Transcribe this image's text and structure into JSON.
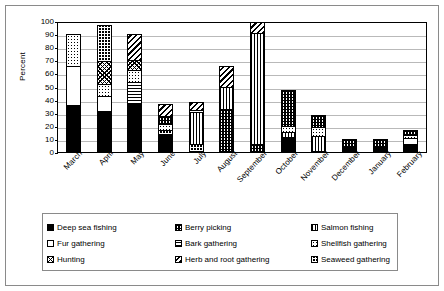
{
  "chart_data": {
    "type": "bar",
    "subtype": "stacked-bar",
    "title": "",
    "xlabel": "",
    "ylabel": "Percent",
    "ylim": [
      0,
      100
    ],
    "ytick_step": 10,
    "yticks": [
      100,
      90,
      80,
      70,
      60,
      50,
      40,
      30,
      20,
      10,
      0
    ],
    "grid": true,
    "grid_axis": "y",
    "legend_position": "bottom",
    "categories": [
      "March",
      "April",
      "May",
      "June",
      "July",
      "August",
      "September",
      "October",
      "November",
      "December",
      "January",
      "February"
    ],
    "series": [
      {
        "name": "Deep sea fishing",
        "pattern": "solid-black",
        "values": [
          35,
          30,
          36,
          13,
          0,
          0,
          0,
          10,
          0,
          3,
          3,
          5
        ]
      },
      {
        "name": "Fur gathering",
        "pattern": "solid-white",
        "values": [
          30,
          12,
          0,
          0,
          0,
          0,
          0,
          0,
          0,
          0,
          0,
          5
        ]
      },
      {
        "name": "Hunting",
        "pattern": "cross-hatch",
        "values": [
          0,
          18,
          8,
          0,
          0,
          0,
          0,
          0,
          0,
          0,
          0,
          0
        ]
      },
      {
        "name": "Berry picking",
        "pattern": "fine-checker",
        "values": [
          0,
          0,
          0,
          6,
          0,
          32,
          5,
          28,
          9,
          7,
          7,
          4
        ]
      },
      {
        "name": "Bark gathering",
        "pattern": "horizontal-lines",
        "values": [
          0,
          0,
          17,
          0,
          0,
          0,
          0,
          0,
          0,
          0,
          0,
          0
        ]
      },
      {
        "name": "Herb and root gathering",
        "pattern": "diagonal-lines",
        "values": [
          0,
          0,
          20,
          10,
          6,
          17,
          8,
          0,
          0,
          0,
          0,
          0
        ]
      },
      {
        "name": "Salmon fishing",
        "pattern": "vertical-lines",
        "values": [
          0,
          0,
          0,
          0,
          25,
          17,
          86,
          4,
          11,
          0,
          0,
          0
        ]
      },
      {
        "name": "Shellfish gathering",
        "pattern": "dots",
        "values": [
          25,
          9,
          9,
          5,
          2,
          0,
          0,
          5,
          8,
          0,
          0,
          3
        ]
      },
      {
        "name": "Seaweed gathering",
        "pattern": "bold-cross",
        "values": [
          0,
          28,
          0,
          3,
          5,
          0,
          0,
          0,
          0,
          0,
          0,
          0
        ]
      }
    ],
    "totals": [
      90,
      97,
      90,
      37,
      38,
      66,
      99,
      47,
      28,
      10,
      10,
      17
    ],
    "stack_order_bottom_to_top": {
      "March": [
        {
          "series": "Deep sea fishing",
          "from": 0,
          "to": 35
        },
        {
          "series": "Fur gathering",
          "from": 35,
          "to": 65
        },
        {
          "series": "Shellfish gathering",
          "from": 65,
          "to": 90
        }
      ],
      "April": [
        {
          "series": "Deep sea fishing",
          "from": 0,
          "to": 30
        },
        {
          "series": "Fur gathering",
          "from": 30,
          "to": 42
        },
        {
          "series": "Shellfish gathering",
          "from": 42,
          "to": 51
        },
        {
          "series": "Hunting",
          "from": 51,
          "to": 69
        },
        {
          "series": "Seaweed gathering",
          "from": 69,
          "to": 97
        }
      ],
      "May": [
        {
          "series": "Deep sea fishing",
          "from": 0,
          "to": 36
        },
        {
          "series": "Bark gathering",
          "from": 36,
          "to": 53
        },
        {
          "series": "Shellfish gathering",
          "from": 53,
          "to": 62
        },
        {
          "series": "Hunting",
          "from": 62,
          "to": 70
        },
        {
          "series": "Herb and root gathering",
          "from": 70,
          "to": 90
        }
      ],
      "June": [
        {
          "series": "Deep sea fishing",
          "from": 0,
          "to": 13
        },
        {
          "series": "Seaweed gathering",
          "from": 13,
          "to": 16
        },
        {
          "series": "Shellfish gathering",
          "from": 16,
          "to": 21
        },
        {
          "series": "Berry picking",
          "from": 21,
          "to": 27
        },
        {
          "series": "Herb and root gathering",
          "from": 27,
          "to": 37
        }
      ],
      "July": [
        {
          "series": "Seaweed gathering",
          "from": 0,
          "to": 5
        },
        {
          "series": "Salmon fishing",
          "from": 5,
          "to": 30
        },
        {
          "series": "Shellfish gathering",
          "from": 30,
          "to": 32
        },
        {
          "series": "Herb and root gathering",
          "from": 32,
          "to": 38
        }
      ],
      "August": [
        {
          "series": "Berry picking",
          "from": 0,
          "to": 32
        },
        {
          "series": "Salmon fishing",
          "from": 32,
          "to": 49
        },
        {
          "series": "Herb and root gathering",
          "from": 49,
          "to": 66
        }
      ],
      "September": [
        {
          "series": "Berry picking",
          "from": 0,
          "to": 5
        },
        {
          "series": "Salmon fishing",
          "from": 5,
          "to": 91
        },
        {
          "series": "Herb and root gathering",
          "from": 91,
          "to": 99
        }
      ],
      "October": [
        {
          "series": "Deep sea fishing",
          "from": 0,
          "to": 10
        },
        {
          "series": "Salmon fishing",
          "from": 10,
          "to": 14
        },
        {
          "series": "Shellfish gathering",
          "from": 14,
          "to": 19
        },
        {
          "series": "Berry picking",
          "from": 19,
          "to": 47
        }
      ],
      "November": [
        {
          "series": "Salmon fishing",
          "from": 0,
          "to": 11
        },
        {
          "series": "Shellfish gathering",
          "from": 11,
          "to": 19
        },
        {
          "series": "Berry picking",
          "from": 19,
          "to": 28
        }
      ],
      "December": [
        {
          "series": "Deep sea fishing",
          "from": 0,
          "to": 3
        },
        {
          "series": "Berry picking",
          "from": 3,
          "to": 10
        }
      ],
      "January": [
        {
          "series": "Deep sea fishing",
          "from": 0,
          "to": 3
        },
        {
          "series": "Berry picking",
          "from": 3,
          "to": 10
        }
      ],
      "February": [
        {
          "series": "Deep sea fishing",
          "from": 0,
          "to": 5
        },
        {
          "series": "Fur gathering",
          "from": 5,
          "to": 10
        },
        {
          "series": "Shellfish gathering",
          "from": 10,
          "to": 13
        },
        {
          "series": "Berry picking",
          "from": 13,
          "to": 17
        }
      ]
    }
  },
  "axis": {
    "y_title": "Percent",
    "y_ticks": [
      "100",
      "90",
      "80",
      "70",
      "60",
      "50",
      "40",
      "30",
      "20",
      "10",
      "0"
    ],
    "x_ticks": [
      "March",
      "April",
      "May",
      "June",
      "July",
      "August",
      "September",
      "October",
      "November",
      "December",
      "January",
      "February"
    ]
  },
  "legend": {
    "items": [
      {
        "label": "Deep sea fishing",
        "swatch": "solid-black-swatch"
      },
      {
        "label": "Berry picking",
        "swatch": "fine-checker-swatch"
      },
      {
        "label": "Salmon fishing",
        "swatch": "vertical-lines-swatch"
      },
      {
        "label": "Fur gathering",
        "swatch": "solid-white-swatch"
      },
      {
        "label": "Bark gathering",
        "swatch": "horizontal-lines-swatch"
      },
      {
        "label": "Shellfish gathering",
        "swatch": "dots-swatch"
      },
      {
        "label": "Hunting",
        "swatch": "cross-hatch-swatch"
      },
      {
        "label": "Herb and root gathering",
        "swatch": "diagonal-lines-swatch"
      },
      {
        "label": "Seaweed gathering",
        "swatch": "bold-cross-swatch"
      }
    ]
  },
  "colors": {
    "ink": "#000000",
    "gridline": "#b9b9b9",
    "frame": "#8a8a8a",
    "background": "#ffffff"
  }
}
